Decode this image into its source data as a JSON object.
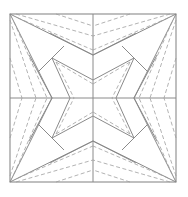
{
  "diagram": {
    "type": "crease-pattern",
    "square": {
      "x": 10,
      "y": 14,
      "w": 166,
      "h": 168
    },
    "colors": {
      "solid": "#8a8a8a",
      "dashed": "#a0a0a0",
      "background": "#ffffff"
    },
    "center": {
      "x": 93,
      "y": 98
    }
  }
}
